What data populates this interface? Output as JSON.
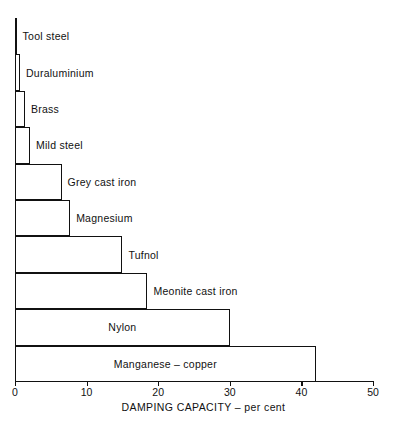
{
  "chart_data": {
    "type": "bar",
    "orientation": "horizontal",
    "title": "",
    "xlabel": "DAMPING  CAPACITY – per cent",
    "ylabel": "",
    "xlim": [
      0,
      50
    ],
    "grid": false,
    "legend": null,
    "x_ticks": [
      0,
      10,
      20,
      30,
      40,
      50
    ],
    "x_tick_labels": [
      "0",
      "10",
      "20",
      "30",
      "40",
      "50"
    ],
    "categories": [
      "Tool steel",
      "Duraluminium",
      "Brass",
      "Mild steel",
      "Grey cast iron",
      "Magnesium",
      "Tufnol",
      "Meonite cast iron",
      "Nylon",
      "Manganese – copper"
    ],
    "values": [
      0.2,
      0.7,
      1.4,
      2.1,
      6.5,
      7.7,
      15.0,
      18.5,
      30.0,
      42.0
    ],
    "bars": [
      {
        "label": "Tool steel",
        "value": 0.2,
        "label_position": "outside"
      },
      {
        "label": "Duraluminium",
        "value": 0.7,
        "label_position": "outside"
      },
      {
        "label": "Brass",
        "value": 1.4,
        "label_position": "outside"
      },
      {
        "label": "Mild steel",
        "value": 2.1,
        "label_position": "outside"
      },
      {
        "label": "Grey cast iron",
        "value": 6.5,
        "label_position": "outside"
      },
      {
        "label": "Magnesium",
        "value": 7.7,
        "label_position": "outside"
      },
      {
        "label": "Tufnol",
        "value": 15.0,
        "label_position": "outside"
      },
      {
        "label": "Meonite cast iron",
        "value": 18.5,
        "label_position": "outside"
      },
      {
        "label": "Nylon",
        "value": 30.0,
        "label_position": "inside"
      },
      {
        "label": "Manganese – copper",
        "value": 42.0,
        "label_position": "inside"
      }
    ],
    "bar_color": "#ffffff",
    "bar_edge_color": "#111111",
    "axis_color": "#111111",
    "background_color": "#ffffff"
  }
}
